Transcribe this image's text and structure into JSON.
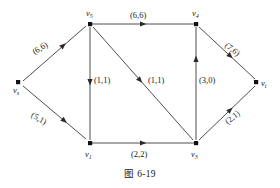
{
  "figure": {
    "caption": "图 6-19",
    "type": "network-flow-graph"
  },
  "vertices": [
    {
      "id": "vs",
      "label": "v",
      "subscript": "s",
      "x": 18,
      "y": 82
    },
    {
      "id": "v5",
      "label": "v",
      "subscript": "5",
      "x": 90,
      "y": 24
    },
    {
      "id": "v4",
      "label": "v",
      "subscript": "4",
      "x": 196,
      "y": 24
    },
    {
      "id": "vt",
      "label": "v",
      "subscript": "t",
      "x": 258,
      "y": 82
    },
    {
      "id": "v1",
      "label": "v",
      "subscript": "1",
      "x": 90,
      "y": 143
    },
    {
      "id": "v3",
      "label": "v",
      "subscript": "3",
      "x": 196,
      "y": 143
    }
  ],
  "edges": [
    {
      "id": "vs-v5",
      "from": "vs",
      "to": "v5",
      "capacity": 6,
      "flow": 6,
      "label": "(6,6)"
    },
    {
      "id": "vs-v1",
      "from": "vs",
      "to": "v1",
      "capacity": 5,
      "flow": 1,
      "label": "(5,1)"
    },
    {
      "id": "v5-v4",
      "from": "v5",
      "to": "v4",
      "capacity": 6,
      "flow": 6,
      "label": "(6,6)"
    },
    {
      "id": "v5-v1",
      "from": "v5",
      "to": "v1",
      "capacity": 1,
      "flow": 1,
      "label": "(1,1)"
    },
    {
      "id": "v5-v3",
      "from": "v5",
      "to": "v3",
      "capacity": 1,
      "flow": 1,
      "label": "(1,1)"
    },
    {
      "id": "v1-v3",
      "from": "v1",
      "to": "v3",
      "capacity": 2,
      "flow": 2,
      "label": "(2,2)"
    },
    {
      "id": "v3-v4",
      "from": "v3",
      "to": "v4",
      "capacity": 3,
      "flow": 0,
      "label": "(3,0)"
    },
    {
      "id": "v4-vt",
      "from": "v4",
      "to": "vt",
      "capacity": 7,
      "flow": 6,
      "label": "(7,6)"
    },
    {
      "id": "v3-vt",
      "from": "v3",
      "to": "vt",
      "capacity": 2,
      "flow": 1,
      "label": "(2,1)"
    }
  ],
  "vertex_labels": {
    "vs": {
      "base": "v",
      "sub": "s"
    },
    "v5": {
      "base": "v",
      "sub": "5"
    },
    "v4": {
      "base": "v",
      "sub": "4"
    },
    "vt": {
      "base": "v",
      "sub": "t"
    },
    "v1": {
      "base": "v",
      "sub": "1"
    },
    "v3": {
      "base": "v",
      "sub": "3"
    }
  },
  "edge_labels": {
    "vs_v5": "(6,6)",
    "vs_v1": "(5,1)",
    "v5_v4": "(6,6)",
    "v5_v1": "(1,1)",
    "v5_v3": "(1,1)",
    "v1_v3": "(2,2)",
    "v3_v4": "(3,0)",
    "v4_vt": "(7,6)",
    "v3_vt": "(2,1)"
  },
  "colors": {
    "edge": "#3a3a3a",
    "vertex": "#111111",
    "text": "#1a1a1a",
    "background": "#ffffff"
  }
}
